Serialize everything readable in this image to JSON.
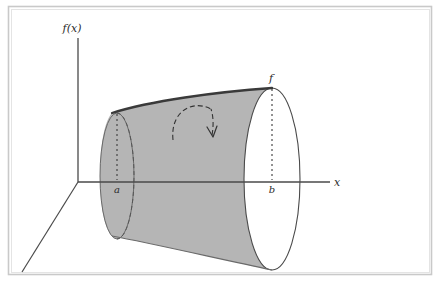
{
  "figure": {
    "domain": "Diagram",
    "width": 439,
    "height": 289,
    "background_color": "#ffffff",
    "border_color": "#c9c9c9"
  },
  "axes": {
    "y_axis_label": "f(x)",
    "x_axis_label": "x",
    "z_axis_label": "",
    "axis_color": "#4a4a4a",
    "origin": {
      "x": 78,
      "y": 182
    }
  },
  "curve": {
    "label": "f",
    "color": "#3a3a3a",
    "description": "increasing profile curve rotated about the x-axis"
  },
  "bounds": {
    "left_label": "a",
    "right_label": "b",
    "left_x": 117,
    "right_x": 272
  },
  "solid": {
    "fill_color": "#b5b5b5",
    "edge_color": "#555555",
    "left_disc_filled": true,
    "right_disc_filled": false
  },
  "rotation_arrow": {
    "style": "dashed-arc",
    "direction": "clockwise-about-x-axis",
    "color": "#333333"
  }
}
